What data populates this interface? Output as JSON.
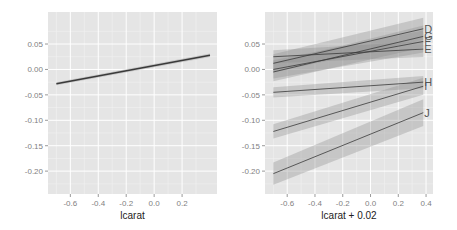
{
  "chart_data": [
    {
      "type": "line",
      "panel": "left",
      "title": "",
      "xlabel": "lcarat",
      "ylabel": "",
      "xlim": [
        -0.76,
        0.45
      ],
      "ylim": [
        -0.245,
        0.113
      ],
      "xticks": [
        -0.6,
        -0.4,
        -0.2,
        0.0,
        0.2
      ],
      "xtick_labels": [
        "-0.6",
        "-0.4",
        "-0.2",
        "0.0",
        "0.2"
      ],
      "yticks": [
        0.05,
        0.0,
        -0.05,
        -0.1,
        -0.15,
        -0.2
      ],
      "ytick_labels": [
        "0.05",
        "0.00",
        "-0.05",
        "-0.10",
        "-0.15",
        "-0.20"
      ],
      "grid": true,
      "series": [
        {
          "name": "",
          "x": [
            -0.7,
            0.4
          ],
          "y": [
            -0.028,
            0.028
          ],
          "band": 0.003
        }
      ]
    },
    {
      "type": "line",
      "panel": "right",
      "title": "",
      "xlabel": "lcarat + 0.02",
      "ylabel": "",
      "xlim": [
        -0.76,
        0.45
      ],
      "ylim": [
        -0.245,
        0.113
      ],
      "xticks": [
        -0.6,
        -0.4,
        -0.2,
        0.0,
        0.2,
        0.4
      ],
      "xtick_labels": [
        "-0.6",
        "-0.4",
        "-0.2",
        "0.0",
        "0.2",
        "0.4"
      ],
      "yticks": [
        0.05,
        0.0,
        -0.05,
        -0.1,
        -0.15,
        -0.2
      ],
      "ytick_labels": [
        "0.05",
        "0.00",
        "-0.05",
        "-0.10",
        "-0.15",
        "-0.20"
      ],
      "grid": true,
      "series": [
        {
          "name": "D",
          "x": [
            -0.7,
            0.38
          ],
          "y": [
            0.012,
            0.08
          ],
          "band": 0.018
        },
        {
          "name": "G",
          "x": [
            -0.7,
            0.38
          ],
          "y": [
            -0.005,
            0.065
          ],
          "band": 0.018
        },
        {
          "name": "F",
          "x": [
            -0.7,
            0.38
          ],
          "y": [
            0.0,
            0.055
          ],
          "band": 0.018
        },
        {
          "name": "E",
          "x": [
            -0.7,
            0.38
          ],
          "y": [
            0.025,
            0.04
          ],
          "band": 0.013
        },
        {
          "name": "H",
          "x": [
            -0.7,
            0.38
          ],
          "y": [
            -0.045,
            -0.025
          ],
          "band": 0.01
        },
        {
          "name": "I",
          "x": [
            -0.7,
            0.38
          ],
          "y": [
            -0.122,
            -0.033
          ],
          "band": 0.014
        },
        {
          "name": "J",
          "x": [
            -0.7,
            0.38
          ],
          "y": [
            -0.205,
            -0.085
          ],
          "band": 0.022
        }
      ]
    }
  ]
}
